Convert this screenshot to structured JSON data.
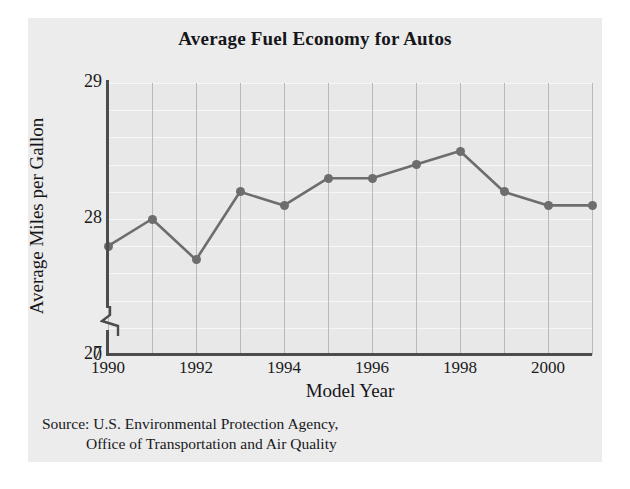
{
  "chart_data": {
    "type": "line",
    "title": "Average Fuel Economy for Autos",
    "xlabel": "Model Year",
    "ylabel": "Average Miles per Gallon",
    "x": [
      1990,
      1991,
      1992,
      1993,
      1994,
      1995,
      1996,
      1997,
      1998,
      1999,
      2000,
      2001
    ],
    "values": [
      27.8,
      28.0,
      27.7,
      28.2,
      28.1,
      28.3,
      28.3,
      28.4,
      28.5,
      28.2,
      28.1,
      28.1
    ],
    "xtick_labels": [
      "1990",
      "1992",
      "1994",
      "1996",
      "1998",
      "2000"
    ],
    "xticks": [
      1990,
      1992,
      1994,
      1996,
      1998,
      2000
    ],
    "ytick_labels": [
      "29",
      "28",
      "27",
      "0"
    ],
    "yticks": [
      29,
      28,
      27,
      0
    ],
    "ylim": [
      27.0,
      29.0
    ],
    "xlim": [
      1990,
      2001
    ],
    "axis_break": true,
    "grid": "both",
    "legend": "none",
    "series_name": "Average Miles per Gallon",
    "marker": "circle"
  },
  "colors": {
    "page_background": "#ffffff",
    "panel_background": "#ececec",
    "plot_background": "#e8e8e8",
    "series": "#6d6d6d",
    "axis": "#4c4c4c",
    "vertical_gridline": "#b9b9b9",
    "horizontal_gridline": "#f7f7f7",
    "text": "#18181c"
  },
  "source": {
    "line1": "Source: U.S. Environmental Protection Agency,",
    "line2": "Office of Transportation and Air Quality"
  }
}
